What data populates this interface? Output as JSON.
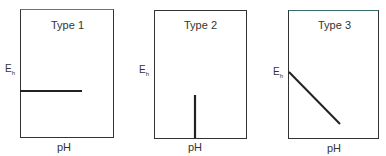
{
  "panels": [
    {
      "title": "Type 1",
      "ylabel": "E",
      "ylabel_sub": "h",
      "xlabel": "pH",
      "line": "horizontal"
    },
    {
      "title": "Type 2",
      "ylabel": "E",
      "ylabel_sub": "h",
      "xlabel": "pH",
      "line": "vertical"
    },
    {
      "title": "Type 3",
      "ylabel": "E",
      "ylabel_sub": "h",
      "xlabel": "pH",
      "line": "diagonal"
    }
  ],
  "colors": {
    "box": "#333333",
    "line": "#222222",
    "top_edge_panel1": "#d04040"
  }
}
